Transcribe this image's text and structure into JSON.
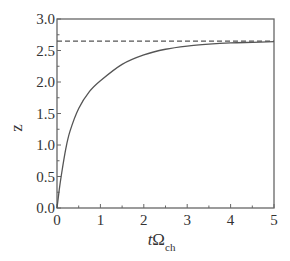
{
  "chart_data": {
    "type": "line",
    "title": "",
    "xlabel": "tΩ_ch",
    "xlabel_main": "tΩ",
    "xlabel_sub": "ch",
    "ylabel": "z",
    "xlim": [
      0,
      5
    ],
    "ylim": [
      0,
      3.0
    ],
    "x_ticks": [
      "0",
      "1",
      "2",
      "3",
      "4",
      "5"
    ],
    "y_ticks": [
      "0.0",
      "0.5",
      "1.0",
      "1.5",
      "2.0",
      "2.5",
      "3.0"
    ],
    "grid": false,
    "legend": null,
    "series": [
      {
        "name": "z(t)",
        "style": "solid",
        "color": "#555555",
        "x": [
          0,
          0.05,
          0.1,
          0.2,
          0.3,
          0.5,
          0.75,
          1.0,
          1.5,
          2.0,
          2.5,
          3.0,
          3.5,
          4.0,
          4.5,
          5.0
        ],
        "y": [
          0,
          0.28,
          0.52,
          0.93,
          1.22,
          1.58,
          1.85,
          2.02,
          2.28,
          2.43,
          2.52,
          2.57,
          2.6,
          2.62,
          2.63,
          2.64
        ]
      },
      {
        "name": "asymptote",
        "style": "dashed",
        "color": "#555555",
        "x": [
          0,
          5
        ],
        "y": [
          2.65,
          2.65
        ]
      }
    ]
  }
}
